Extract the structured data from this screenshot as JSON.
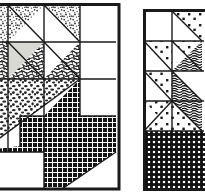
{
  "figure": {
    "kind": "line-art-illustration",
    "background_color": "#ffffff",
    "ink_color": "#1a1a1a",
    "canvas": {
      "width": 205,
      "height": 196
    }
  },
  "blocks": [
    {
      "id": "left-block",
      "name": "maple-leaf-quilt-block-left",
      "cropped_edges": [
        "left"
      ],
      "frame": {
        "x": -26,
        "y": 4,
        "width": 146,
        "height": 185
      },
      "border_color": "#1a1a1a",
      "border_width": 3,
      "grid": {
        "columns": 4,
        "rows": 4,
        "cell": 36
      },
      "patches": [
        {
          "name": "patch-r1c1-triangle",
          "shape": "triangle",
          "fill": "stipple-fine",
          "corner": "upper-left"
        },
        {
          "name": "patch-r1c2-triangle",
          "shape": "triangle",
          "fill": "stipple-fine",
          "corner": "upper-right"
        },
        {
          "name": "patch-r1c3-triangle",
          "shape": "triangle",
          "fill": "stipple-fine",
          "corner": "upper-left"
        },
        {
          "name": "patch-r1c4-plain",
          "shape": "square",
          "fill": "white",
          "corner": "none"
        },
        {
          "name": "patch-r2c1-triangle",
          "shape": "triangle",
          "fill": "scribble-dark",
          "corner": "lower-left"
        },
        {
          "name": "patch-r2c2-triangle",
          "shape": "triangle",
          "fill": "gray-light",
          "corner": "upper-left"
        },
        {
          "name": "patch-r2c2-triangle-b",
          "shape": "triangle",
          "fill": "scribble-dark",
          "corner": "lower-right"
        },
        {
          "name": "patch-r2c3-triangle",
          "shape": "triangle",
          "fill": "white",
          "corner": "upper-left"
        },
        {
          "name": "patch-r2c3-triangle-b",
          "shape": "triangle",
          "fill": "scribble-dark",
          "corner": "lower-right"
        },
        {
          "name": "patch-r2c4-plain",
          "shape": "square",
          "fill": "white",
          "corner": "none"
        },
        {
          "name": "patch-big-speckle-triangle",
          "shape": "large-triangle",
          "fill": "speckle-coarse",
          "corner": "upper-left"
        },
        {
          "name": "patch-leaf-stem",
          "shape": "stem-polygon",
          "fill": "crosshatch-dark",
          "corner": "none"
        },
        {
          "name": "patch-bottom-left-plain",
          "shape": "rect",
          "fill": "white",
          "corner": "none"
        },
        {
          "name": "patch-bottom-right-plain",
          "shape": "rect",
          "fill": "white",
          "corner": "none"
        }
      ]
    },
    {
      "id": "right-block",
      "name": "maple-leaf-quilt-block-right",
      "cropped_edges": [
        "right"
      ],
      "frame": {
        "x": 144,
        "y": 10,
        "width": 120,
        "height": 180
      },
      "border_color": "#1a1a1a",
      "border_width": 3,
      "grid": {
        "columns": 4,
        "rows": 4,
        "cell": 30
      },
      "patches": [
        {
          "name": "patch-r1c1-plain",
          "shape": "square",
          "fill": "white",
          "corner": "none"
        },
        {
          "name": "patch-r1c2-triangle",
          "shape": "triangle",
          "fill": "dotted-squares",
          "corner": "upper-right"
        },
        {
          "name": "patch-r2c1-triangle",
          "shape": "triangle",
          "fill": "dotted-squares",
          "corner": "upper-right"
        },
        {
          "name": "patch-r2c2-triangle",
          "shape": "triangle",
          "fill": "woodgrain-dark",
          "corner": "lower-right"
        },
        {
          "name": "patch-r3c1-triangle",
          "shape": "triangle",
          "fill": "dotted-squares",
          "corner": "upper-right"
        },
        {
          "name": "patch-r3c2-triangle",
          "shape": "triangle",
          "fill": "woodgrain-dark",
          "corner": "lower-right"
        },
        {
          "name": "patch-r4c1-triangle",
          "shape": "triangle",
          "fill": "dotted-squares",
          "corner": "upper-right"
        },
        {
          "name": "patch-r4c2-triangle",
          "shape": "triangle",
          "fill": "woodgrain-dark",
          "corner": "lower-right"
        },
        {
          "name": "patch-bottom-band",
          "shape": "rect",
          "fill": "checker-dark",
          "corner": "none"
        }
      ]
    }
  ],
  "fill_legend": [
    {
      "key": "white",
      "label": "plain / unprinted",
      "color": "#ffffff"
    },
    {
      "key": "gray-light",
      "label": "light solid",
      "color": "#d9d9d4"
    },
    {
      "key": "stipple-fine",
      "label": "fine stipple print",
      "color": "#2b2b2b"
    },
    {
      "key": "speckle-coarse",
      "label": "coarse speckle",
      "color": "#262626"
    },
    {
      "key": "scribble-dark",
      "label": "dark scribble",
      "color": "#1f1f1f"
    },
    {
      "key": "crosshatch-dark",
      "label": "dark crosshatch",
      "color": "#141414"
    },
    {
      "key": "dotted-squares",
      "label": "dotted square print",
      "color": "#1a1a1a"
    },
    {
      "key": "woodgrain-dark",
      "label": "dark wood grain",
      "color": "#161616"
    },
    {
      "key": "checker-dark",
      "label": "dark checkerboard",
      "color": "#101010"
    }
  ]
}
